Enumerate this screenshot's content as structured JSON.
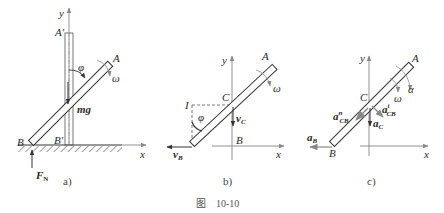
{
  "figure_caption": "图　10-10",
  "panels": [
    {
      "caption": "a)",
      "labels": {
        "y_axis": "y",
        "x_axis": "x",
        "top_end": "A",
        "top_end_prime": "A′",
        "bottom_end": "B",
        "bottom_end_prime": "B′",
        "angle": "φ",
        "angular_velocity": "ω",
        "weight": "mg",
        "normal_force": "F",
        "normal_force_sub": "N"
      }
    },
    {
      "caption": "b)",
      "labels": {
        "y_axis": "y",
        "x_axis": "x",
        "top_end": "A",
        "bottom_end": "B",
        "center": "C",
        "instant_center": "I",
        "angle": "φ",
        "angular_velocity": "ω",
        "velocity_c": "v",
        "velocity_c_sub": "C",
        "velocity_b": "v",
        "velocity_b_sub": "B"
      }
    },
    {
      "caption": "c)",
      "labels": {
        "y_axis": "y",
        "x_axis": "x",
        "top_end": "A",
        "bottom_end": "B",
        "center": "C",
        "angular_accel": "α",
        "angular_velocity": "ω",
        "accel_b": "a",
        "accel_b_sub": "B",
        "accel_c": "a",
        "accel_c_sub": "C",
        "accel_cb_n": "a",
        "accel_cb_n_sub": "CB",
        "accel_cb_n_sup": "n",
        "accel_cb_t": "a",
        "accel_cb_t_sub": "CB",
        "accel_cb_t_sup": "t"
      }
    }
  ]
}
